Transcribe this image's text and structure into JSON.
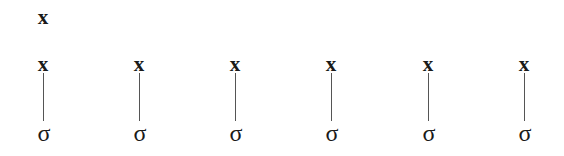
{
  "diagram": {
    "top_node": {
      "label": "x",
      "column": 0
    },
    "columns": [
      {
        "top_label": "x",
        "bottom_label": "σ"
      },
      {
        "top_label": "x",
        "bottom_label": "σ"
      },
      {
        "top_label": "x",
        "bottom_label": "σ"
      },
      {
        "top_label": "x",
        "bottom_label": "σ"
      },
      {
        "top_label": "x",
        "bottom_label": "σ"
      },
      {
        "top_label": "x",
        "bottom_label": "σ"
      }
    ],
    "edges": [
      {
        "from": "columns.0.top_label",
        "to": "columns.0.bottom_label"
      },
      {
        "from": "columns.1.top_label",
        "to": "columns.1.bottom_label"
      },
      {
        "from": "columns.2.top_label",
        "to": "columns.2.bottom_label"
      },
      {
        "from": "columns.3.top_label",
        "to": "columns.3.bottom_label"
      },
      {
        "from": "columns.4.top_label",
        "to": "columns.4.bottom_label"
      },
      {
        "from": "columns.5.top_label",
        "to": "columns.5.bottom_label"
      }
    ]
  }
}
